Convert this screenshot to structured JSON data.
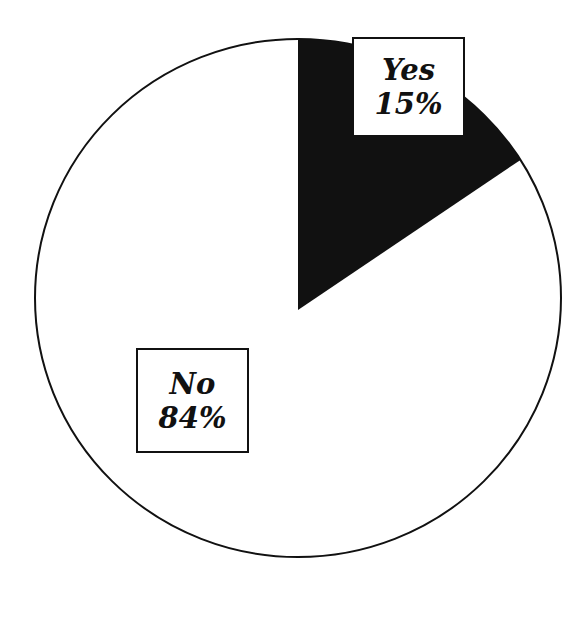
{
  "chart_data": {
    "type": "pie",
    "title": "",
    "categories": [
      "Yes",
      "No"
    ],
    "values": [
      15,
      84
    ],
    "labels": [
      {
        "name": "Yes",
        "percent": "15%"
      },
      {
        "name": "No",
        "percent": "84%"
      }
    ],
    "colors": {
      "Yes": "#111111",
      "No": "#ffffff"
    },
    "start_angle_deg": 0,
    "direction": "clockwise",
    "legend": "none (inline boxed labels)"
  },
  "labels": {
    "yes": {
      "name": "Yes",
      "percent": "15%"
    },
    "no": {
      "name": "No",
      "percent": "84%"
    }
  }
}
